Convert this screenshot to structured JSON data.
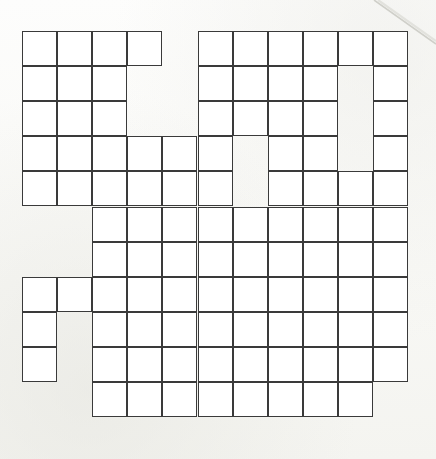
{
  "document": {
    "type": "crossword-puzzle-grid",
    "title": "Blank Crossword Grid",
    "description": "An empty crossword puzzle grid printed on off-white paper, scanned.",
    "background_color": "#fbfbf9",
    "paper_color": "#fdfdfc"
  },
  "grid": {
    "columns": 11,
    "rows": 11,
    "cell_size": 35.1,
    "origin_x": 22,
    "origin_y": 31,
    "line_color": "#3a3a3a",
    "line_width": 1.9,
    "cell_fill": "#ffffff",
    "filled_cell_count": 102,
    "void_cell_count": 19,
    "legend": {
      "1": "playable lettered cell (white square with border)",
      "0": "void / no square drawn"
    },
    "row_labels": [
      "R1",
      "R2",
      "R3",
      "R4",
      "R5",
      "R6",
      "R7",
      "R8",
      "R9",
      "R10",
      "R11"
    ],
    "column_labels": [
      "C1",
      "C2",
      "C3",
      "C4",
      "C5",
      "C6",
      "C7",
      "C8",
      "C9",
      "C10",
      "C11"
    ],
    "matrix": [
      [
        1,
        1,
        1,
        1,
        0,
        1,
        1,
        1,
        1,
        1,
        1
      ],
      [
        1,
        1,
        1,
        0,
        0,
        1,
        1,
        1,
        1,
        0,
        1
      ],
      [
        1,
        1,
        1,
        0,
        0,
        1,
        1,
        1,
        1,
        0,
        1
      ],
      [
        1,
        1,
        1,
        1,
        1,
        1,
        0,
        1,
        1,
        0,
        1
      ],
      [
        1,
        1,
        1,
        1,
        1,
        1,
        0,
        1,
        1,
        1,
        1
      ],
      [
        0,
        0,
        1,
        1,
        1,
        1,
        1,
        1,
        1,
        1,
        1
      ],
      [
        0,
        0,
        1,
        1,
        1,
        1,
        1,
        1,
        1,
        1,
        1
      ],
      [
        1,
        1,
        1,
        1,
        1,
        1,
        1,
        1,
        1,
        1,
        1
      ],
      [
        1,
        0,
        1,
        1,
        1,
        1,
        1,
        1,
        1,
        1,
        1
      ],
      [
        1,
        0,
        1,
        1,
        1,
        1,
        1,
        1,
        1,
        1,
        1
      ],
      [
        0,
        0,
        1,
        1,
        1,
        1,
        1,
        1,
        1,
        1,
        0
      ]
    ]
  },
  "artifact": {
    "name": "scan-edge-line",
    "color": "#c9c9c4",
    "description": "faint diagonal page-edge line across the top right corner"
  }
}
